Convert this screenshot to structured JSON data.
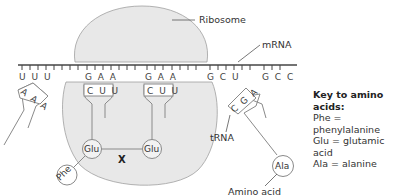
{
  "labels": {
    "ribosome": "Ribosome",
    "mrna": "mRNA",
    "trna": "tRNA",
    "amino_acid": "Amino acid",
    "x_marker": "X"
  },
  "mrna_codons": [
    {
      "text": "U U U",
      "x": 20
    },
    {
      "text": "G A A",
      "x": 85
    },
    {
      "text": "G A A",
      "x": 145
    },
    {
      "text": "G C U",
      "x": 208
    },
    {
      "text": "G C C",
      "x": 262
    }
  ],
  "trnas": [
    {
      "id": "left",
      "anticodon": "A A A",
      "amino_acid": "Phe"
    },
    {
      "id": "middle-1",
      "anticodon": "C U U",
      "amino_acid": "Glu"
    },
    {
      "id": "middle-2",
      "anticodon": "C U U",
      "amino_acid": "Glu"
    },
    {
      "id": "right",
      "anticodon": "C G A",
      "amino_acid": "Ala"
    }
  ],
  "amino_acids_shown": {
    "phe": "Phe",
    "glu1": "Glu",
    "glu2": "Glu",
    "ala": "Ala"
  },
  "key": {
    "title": "Key to amino acids:",
    "entries": [
      "Phe = phenylalanine",
      "Glu = glutamic acid",
      "Ala = alanine"
    ]
  },
  "colors": {
    "ribosome_fill": "#e6e6e6",
    "ribosome_stroke": "#9a9a9a",
    "line": "#7a7a7a",
    "text": "#333333"
  }
}
